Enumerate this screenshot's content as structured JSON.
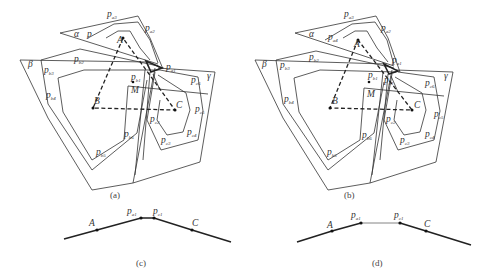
{
  "panels": {
    "a": {
      "caption": "(a)",
      "region_labels": {
        "alpha": "α",
        "beta": "β",
        "gamma": "γ"
      },
      "points": {
        "A": "A",
        "B": "B",
        "C": "C",
        "M": "M"
      },
      "vertex_labels": {
        "pa1": "p",
        "pa1_sub": "a1",
        "pa2": "p",
        "pa2_sub": "a2",
        "pa3": "p",
        "pa3_sub": "a3",
        "pa4": "p",
        "pa4_sub": "",
        "pb1": "p",
        "pb1_sub": "b1",
        "pb2": "p",
        "pb2_sub": "b2",
        "pb3": "p",
        "pb3_sub": "b3",
        "pb4": "p",
        "pb4_sub": "b4",
        "pb5": "p",
        "pb5_sub": "b5",
        "pb6": "p",
        "pb6_sub": "b6",
        "pc1": "p",
        "pc1_sub": "c1",
        "pc2": "p",
        "pc2_sub": "c2",
        "pc3": "p",
        "pc3_sub": "c3",
        "pc4": "p",
        "pc4_sub": "c4",
        "pc5": "p",
        "pc5_sub": "c5",
        "pc6": "p",
        "pc6_sub": "c6"
      }
    },
    "b": {
      "caption": "(b)",
      "region_labels": {
        "alpha": "α",
        "beta": "β",
        "gamma": "γ"
      },
      "points": {
        "A": "A",
        "B": "B",
        "C": "C",
        "M": "M"
      },
      "vertex_labels": {
        "pa1": "p",
        "pa1_sub": "a1",
        "pa2": "p",
        "pa2_sub": "a2",
        "pa3": "p",
        "pa3_sub": "a3",
        "pa4": "p",
        "pa4_sub": "a4",
        "pb1": "p",
        "pb1_sub": "b1",
        "pb2": "p",
        "pb2_sub": "b2",
        "pb3": "p",
        "pb3_sub": "b3",
        "pb4": "p",
        "pb4_sub": "b4",
        "pb5": "p",
        "pb5_sub": "b5",
        "pb6": "p",
        "pb6_sub": "b6",
        "pc1": "p",
        "pc1_sub": "c1",
        "pc2": "p",
        "pc2_sub": "c2",
        "pc3": "p",
        "pc3_sub": "c3",
        "pc4": "p",
        "pc4_sub": "c4",
        "pc5": "p",
        "pc5_sub": "c5",
        "pc6": "p",
        "pc6_sub": "c6"
      }
    },
    "c": {
      "caption": "(c)",
      "labels": {
        "A": "A",
        "pa1": "p",
        "pa1_sub": "a1",
        "pc1": "p",
        "pc1_sub": "c1",
        "C": "C"
      }
    },
    "d": {
      "caption": "(d)",
      "labels": {
        "A": "A",
        "pa1": "p",
        "pa1_sub": "a1",
        "pc1": "p",
        "pc1_sub": "c1",
        "C": "C"
      }
    }
  }
}
